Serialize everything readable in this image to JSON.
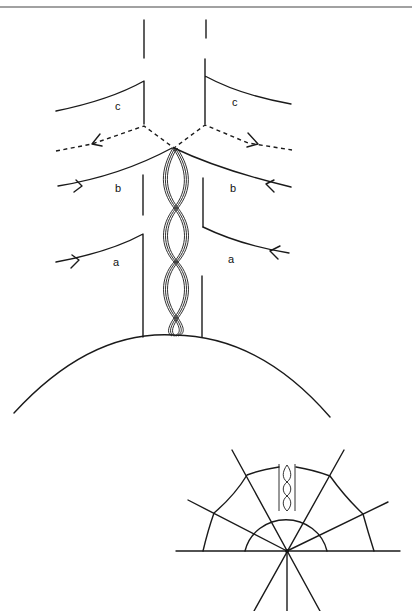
{
  "figure": {
    "top_diagram": {
      "labels": {
        "c_left": "c",
        "c_right": "c",
        "b_left": "b",
        "b_right": "b",
        "a_left": "a",
        "a_right": "a"
      },
      "description": "Handle attached to a sphere with a twisted double band; curves a, b (solid, inward arrows) and c boundary with dashed outgoing arrows"
    },
    "bottom_diagram": {
      "description": "Half-disc with radial lines through center point, small twisted band on top of semicircle, web of connecting curves"
    },
    "colors": {
      "ink": "#1a1a1a",
      "background": "#ffffff"
    }
  }
}
